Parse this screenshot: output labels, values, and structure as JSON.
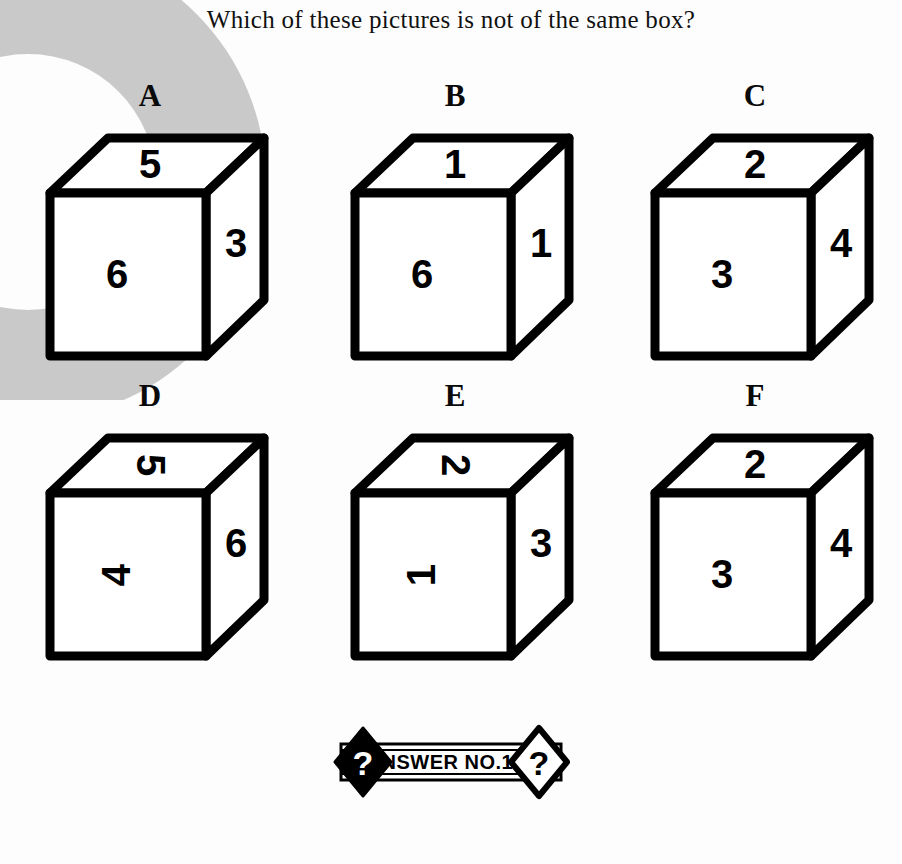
{
  "title": "Which of these pictures is not of the same box?",
  "watermark": {
    "name": "grey-ring-watermark",
    "color": "#c9c9c9"
  },
  "cubes": [
    {
      "label": "A",
      "top": {
        "digit": "5",
        "rotation": 0
      },
      "front": {
        "digit": "6",
        "rotation": 0
      },
      "right": {
        "digit": "3",
        "rotation": 0
      }
    },
    {
      "label": "B",
      "top": {
        "digit": "1",
        "rotation": 0
      },
      "front": {
        "digit": "6",
        "rotation": 0
      },
      "right": {
        "digit": "1",
        "rotation": 0
      }
    },
    {
      "label": "C",
      "top": {
        "digit": "2",
        "rotation": 0
      },
      "front": {
        "digit": "3",
        "rotation": 0
      },
      "right": {
        "digit": "4",
        "rotation": 0
      }
    },
    {
      "label": "D",
      "top": {
        "digit": "5",
        "rotation": 90
      },
      "front": {
        "digit": "4",
        "rotation": -90
      },
      "right": {
        "digit": "6",
        "rotation": 0
      }
    },
    {
      "label": "E",
      "top": {
        "digit": "2",
        "rotation": 90
      },
      "front": {
        "digit": "1",
        "rotation": -90
      },
      "right": {
        "digit": "3",
        "rotation": 0
      }
    },
    {
      "label": "F",
      "top": {
        "digit": "2",
        "rotation": 0
      },
      "front": {
        "digit": "3",
        "rotation": 0
      },
      "right": {
        "digit": "4",
        "rotation": 0
      }
    }
  ],
  "answer_banner": {
    "text": "ANSWER NO.114",
    "left_badge_glyph": "?",
    "right_badge_glyph": "?"
  }
}
